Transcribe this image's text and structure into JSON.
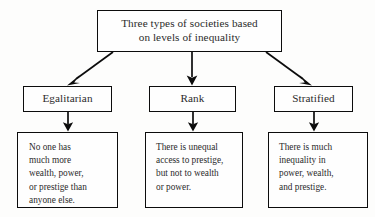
{
  "diagram": {
    "title_box": {
      "line1": "Three types of societies based",
      "line2": "on levels of inequality"
    },
    "categories": [
      {
        "label": "Egalitarian"
      },
      {
        "label": "Rank"
      },
      {
        "label": "Stratified"
      }
    ],
    "descriptions": [
      {
        "lines": [
          "No one has",
          "much more",
          "wealth, power,",
          "or prestige than",
          "anyone else."
        ]
      },
      {
        "lines": [
          "There is unequal",
          "access to prestige,",
          "but not to wealth",
          "or power."
        ]
      },
      {
        "lines": [
          "There is much",
          "inequality in",
          "power, wealth,",
          "and prestige."
        ]
      }
    ],
    "colors": {
      "background": "#fdfdfc",
      "box_border": "#0c0c0c",
      "box_fill": "#fefefe",
      "text": "#2b2b2b",
      "arrow": "#0c0c0c"
    }
  }
}
